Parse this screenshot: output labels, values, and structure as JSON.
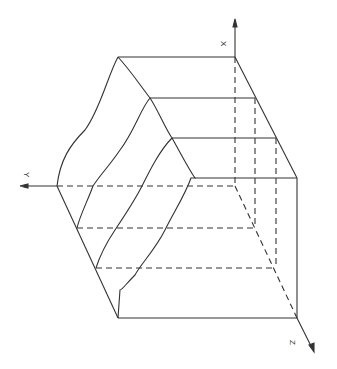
{
  "diagram": {
    "type": "3d-box-schematic",
    "axes": {
      "x_label": "X",
      "y_label": "Y",
      "z_label": "Z"
    },
    "colors": {
      "line": "#333333",
      "background": "#ffffff"
    }
  }
}
